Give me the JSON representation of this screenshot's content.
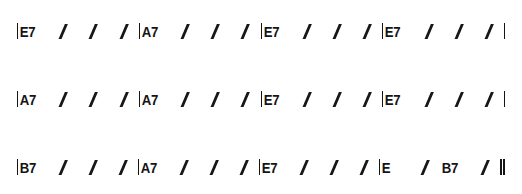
{
  "document": {
    "type": "chord-chart",
    "notation": "rhythm-slash",
    "key": "E",
    "background_color": "#ffffff",
    "ink_color": "#141414"
  },
  "glyphs": {
    "slash": "/",
    "barline": "|",
    "final_barline": "||"
  },
  "chart_data": {
    "type": "table",
    "title": "",
    "xlabel": "",
    "ylabel": "",
    "rows": [
      {
        "index": 1,
        "start_barline": "|",
        "end_barline": "|",
        "measures": [
          {
            "chords": [
              "E7"
            ],
            "beats": [
              "E7",
              "/",
              "/",
              "/"
            ]
          },
          {
            "chords": [
              "A7"
            ],
            "beats": [
              "A7",
              "/",
              "/",
              "/"
            ]
          },
          {
            "chords": [
              "E7"
            ],
            "beats": [
              "E7",
              "/",
              "/",
              "/"
            ]
          },
          {
            "chords": [
              "E7"
            ],
            "beats": [
              "E7",
              "/",
              "/",
              "/"
            ]
          }
        ]
      },
      {
        "index": 2,
        "start_barline": "|",
        "end_barline": "|",
        "measures": [
          {
            "chords": [
              "A7"
            ],
            "beats": [
              "A7",
              "/",
              "/",
              "/"
            ]
          },
          {
            "chords": [
              "A7"
            ],
            "beats": [
              "A7",
              "/",
              "/",
              "/"
            ]
          },
          {
            "chords": [
              "E7"
            ],
            "beats": [
              "E7",
              "/",
              "/",
              "/"
            ]
          },
          {
            "chords": [
              "E7"
            ],
            "beats": [
              "E7",
              "/",
              "/",
              "/"
            ]
          }
        ]
      },
      {
        "index": 3,
        "start_barline": "|",
        "end_barline": "||",
        "measures": [
          {
            "chords": [
              "B7"
            ],
            "beats": [
              "B7",
              "/",
              "/",
              "/"
            ]
          },
          {
            "chords": [
              "A7"
            ],
            "beats": [
              "A7",
              "/",
              "/",
              "/"
            ]
          },
          {
            "chords": [
              "E7"
            ],
            "beats": [
              "E7",
              "/",
              "/",
              "/"
            ]
          },
          {
            "chords": [
              "E",
              "B7"
            ],
            "beats": [
              "E",
              "/",
              "B7",
              "/"
            ]
          }
        ]
      }
    ]
  }
}
